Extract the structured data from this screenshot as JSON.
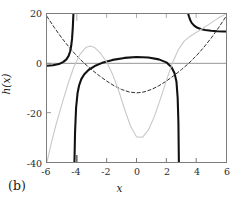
{
  "panel": {
    "label": "(b)"
  },
  "chart_data": {
    "type": "line",
    "title": "",
    "xlabel": "x",
    "ylabel": "h(x)",
    "xlim": [
      -6,
      6
    ],
    "ylim": [
      -40,
      20
    ],
    "xticks": [
      -6,
      -4,
      -2,
      0,
      2,
      4,
      6
    ],
    "xtick_labels": [
      "-6",
      "-4",
      "-2",
      "0",
      "2",
      "4",
      "6"
    ],
    "yticks": [
      20,
      0,
      -20,
      -40
    ],
    "ytick_labels": [
      "20",
      "0",
      "-20",
      "-40"
    ],
    "grid": false,
    "legend": "none",
    "zero_line": true,
    "series": [
      {
        "name": "h-solid",
        "style": "solid-thick",
        "color": "#111111",
        "linewidth": 2.1,
        "asymptotes": [
          -4.2,
          2.85,
          3.45
        ],
        "branches": [
          {
            "comment": "left branch rising from near 0 at x=-6 to +infinity at x=-4.2",
            "x": [
              -6.0,
              -5.6,
              -5.2,
              -4.9,
              -4.7,
              -4.55,
              -4.45,
              -4.38,
              -4.32,
              -4.27,
              -4.23
            ],
            "y": [
              -1.0,
              -0.8,
              -0.3,
              0.6,
              1.6,
              3.0,
              4.8,
              7.0,
              10.0,
              14.5,
              20.0
            ]
          },
          {
            "comment": "middle branch from -infinity at x=-4.18 up over a flat plateau then down to -infinity at x=2.85",
            "x": [
              -4.16,
              -4.12,
              -4.05,
              -3.95,
              -3.85,
              -3.7,
              -3.5,
              -3.2,
              -2.8,
              -2.3,
              -1.6,
              -0.8,
              0.0,
              0.8,
              1.5,
              2.0,
              2.35,
              2.55,
              2.68,
              2.76,
              2.81,
              2.84
            ],
            "y": [
              -40.0,
              -28.0,
              -18.0,
              -12.0,
              -9.0,
              -6.4,
              -4.4,
              -2.6,
              -1.1,
              0.2,
              1.4,
              2.2,
              2.6,
              2.4,
              1.6,
              0.4,
              -1.6,
              -4.0,
              -7.5,
              -14.0,
              -24.0,
              -40.0
            ]
          },
          {
            "comment": "right branch descending from +infinity near x=3.45 to a flat tail near 13",
            "x": [
              3.47,
              3.52,
              3.6,
              3.7,
              3.85,
              4.05,
              4.3,
              4.6,
              5.0,
              5.4,
              5.8,
              6.0
            ],
            "y": [
              20.0,
              19.0,
              17.6,
              16.4,
              15.4,
              14.5,
              13.9,
              13.5,
              13.2,
              13.0,
              12.9,
              12.9
            ]
          }
        ]
      },
      {
        "name": "h-dashed",
        "style": "dashed",
        "color": "#2e2e2e",
        "linewidth": 1.0,
        "branches": [
          {
            "comment": "upward-opening curve, minimum about -12 at x=0",
            "x": [
              -6.0,
              -5.5,
              -5.0,
              -4.5,
              -4.0,
              -3.5,
              -3.0,
              -2.5,
              -2.0,
              -1.5,
              -1.0,
              -0.5,
              0.0,
              0.5,
              1.0,
              1.5,
              2.0,
              2.5,
              3.0,
              3.5,
              4.0,
              4.5,
              5.0,
              5.5,
              6.0
            ],
            "y": [
              19.0,
              14.4,
              10.2,
              6.4,
              3.0,
              0.0,
              -2.6,
              -5.0,
              -7.2,
              -9.1,
              -10.6,
              -11.6,
              -12.0,
              -11.6,
              -10.6,
              -9.1,
              -7.2,
              -5.0,
              -2.6,
              0.0,
              3.0,
              6.4,
              10.2,
              14.4,
              19.0
            ]
          }
        ]
      },
      {
        "name": "h-light",
        "style": "solid-thin",
        "color": "#c8c8c8",
        "linewidth": 1.1,
        "branches": [
          {
            "comment": "light gray curve, peak about 7 near x=-3.1, deep minimum about -30 at x=0, rising steeply at the right",
            "x": [
              -6.0,
              -5.7,
              -5.4,
              -5.0,
              -4.6,
              -4.2,
              -3.8,
              -3.4,
              -3.1,
              -2.8,
              -2.4,
              -2.0,
              -1.6,
              -1.2,
              -0.8,
              -0.4,
              0.0,
              0.4,
              0.8,
              1.2,
              1.6,
              2.0,
              2.4,
              2.8,
              3.2,
              3.6,
              4.0,
              4.4,
              4.8,
              5.2,
              5.6,
              6.0
            ],
            "y": [
              -40.0,
              -32.0,
              -25.0,
              -16.5,
              -8.5,
              -1.5,
              3.5,
              6.4,
              7.0,
              6.4,
              4.0,
              0.5,
              -4.5,
              -11.0,
              -18.5,
              -25.5,
              -29.8,
              -30.0,
              -27.0,
              -21.5,
              -14.5,
              -7.0,
              0.0,
              5.5,
              9.0,
              11.0,
              12.5,
              14.0,
              15.6,
              17.2,
              18.8,
              20.0
            ]
          }
        ]
      }
    ]
  }
}
